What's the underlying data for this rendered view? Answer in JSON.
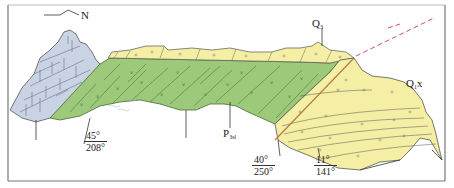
{
  "diagram": {
    "type": "geological-cross-section",
    "compass": {
      "label": "N"
    },
    "units": [
      {
        "id": "limestone",
        "description": "bedded limestone block (left)",
        "color": "#c9d3e3"
      },
      {
        "id": "P3sl",
        "label_main": "P",
        "label_sub": "3sl",
        "color": "#9cc97a"
      },
      {
        "id": "Q3",
        "label_main": "Q",
        "label_sub": "3",
        "color": "#f4efa5"
      },
      {
        "id": "Q1x",
        "label_main": "Q",
        "label_sub": "1",
        "label_suffix": "x",
        "color": "#f4efa5"
      }
    ],
    "attitudes": [
      {
        "dip": "45°",
        "azimuth": "208°"
      },
      {
        "dip": "40°",
        "azimuth": "250°"
      },
      {
        "dip": "11°",
        "azimuth": "141°"
      }
    ],
    "fault": {
      "color": "#d0506a",
      "style": "dashed"
    }
  }
}
